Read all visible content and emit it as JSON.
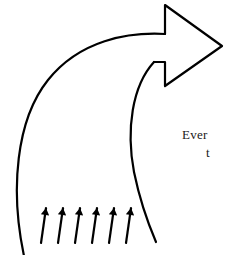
{
  "figure": {
    "background_color": "#ffffff",
    "stroke_color": "#000000",
    "text_color": "#1a1a1a",
    "width": 225,
    "height": 255
  },
  "labels": {
    "line_1": "Ever",
    "line_2": "t"
  },
  "main_arrow": {
    "name": "curved-outline-arrow",
    "description": "large open curved arrow sweeping from bottom-left up and around to the right",
    "stroke_width": 2.2,
    "outer_curve_path": "M 24 256 C 10 190, 16 120, 48 80 C 80 40, 128 32, 165 34",
    "inner_curve_path": "M 154 62 C 132 86, 126 130, 134 172 C 141 206, 150 228, 156 242",
    "arrowhead_path": "M 165 34 L 165 5 L 222 46 L 165 86 L 165 62 L 154 62",
    "tip_x": 222,
    "tip_y": 46
  },
  "inflow_arrows": {
    "name": "inflow-arrow-group",
    "count": 6,
    "description": "six small solid arrows pointing up and slightly right",
    "stroke_width": 2.2,
    "head_length": 7,
    "items": [
      {
        "x1": 41,
        "y1": 243,
        "x2": 46,
        "y2": 208
      },
      {
        "x1": 58,
        "y1": 243,
        "x2": 63,
        "y2": 208
      },
      {
        "x1": 75,
        "y1": 243,
        "x2": 80,
        "y2": 208
      },
      {
        "x1": 92,
        "y1": 243,
        "x2": 97,
        "y2": 208
      },
      {
        "x1": 109,
        "y1": 243,
        "x2": 114,
        "y2": 208
      },
      {
        "x1": 126,
        "y1": 243,
        "x2": 131,
        "y2": 208
      }
    ]
  }
}
